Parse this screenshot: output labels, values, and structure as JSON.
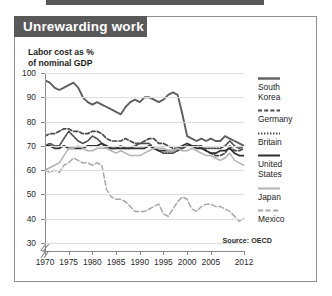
{
  "header": {
    "title": "Unrewarding work"
  },
  "axis_title": "Labor cost as %\nof nominal GDP",
  "source": "Source: OECD",
  "legend": [
    {
      "name": "South Korea",
      "label": "South\nKorea",
      "style": "solid-thick",
      "color": "#5e5e5e"
    },
    {
      "name": "Germany",
      "label": "Germany",
      "style": "dashed",
      "color": "#4a4a4a"
    },
    {
      "name": "Britain",
      "label": "Britain",
      "style": "dotted",
      "color": "#4a4a4a"
    },
    {
      "name": "United States",
      "label": "United\nStates",
      "style": "solid",
      "color": "#2f2f2f"
    },
    {
      "name": "Japan",
      "label": "Japan",
      "style": "solid-light",
      "color": "#b2b2b2"
    },
    {
      "name": "Mexico",
      "label": "Mexico",
      "style": "long-dash",
      "color": "#a8a8a8"
    }
  ],
  "chart_data": {
    "type": "line",
    "title": "Unrewarding work",
    "subtitle": "Labor cost as % of nominal GDP",
    "xlabel": "",
    "ylabel": "Labor cost as % of nominal GDP",
    "source": "Source: OECD",
    "xlim": [
      1970,
      2012
    ],
    "ylim": [
      30,
      100
    ],
    "yticks": [
      30,
      40,
      50,
      60,
      70,
      80,
      90,
      100
    ],
    "xticks": [
      1970,
      1975,
      1980,
      1985,
      1990,
      1995,
      2000,
      2005,
      2012
    ],
    "y_axis_break_below": 30,
    "grid": "horizontal",
    "legend_position": "right",
    "x": [
      1970,
      1971,
      1972,
      1973,
      1974,
      1975,
      1976,
      1977,
      1978,
      1979,
      1980,
      1981,
      1982,
      1983,
      1984,
      1985,
      1986,
      1987,
      1988,
      1989,
      1990,
      1991,
      1992,
      1993,
      1994,
      1995,
      1996,
      1997,
      1998,
      1999,
      2000,
      2001,
      2002,
      2003,
      2004,
      2005,
      2006,
      2007,
      2008,
      2009,
      2010,
      2011,
      2012
    ],
    "series": [
      {
        "name": "South Korea",
        "style": "solid-thick",
        "color": "#5e5e5e",
        "values": [
          97,
          96,
          94,
          93,
          94,
          95,
          96,
          94,
          90,
          88,
          87,
          88,
          87,
          86,
          85,
          84,
          83,
          86,
          88,
          89,
          88,
          90,
          90,
          89,
          88,
          89,
          91,
          92,
          91,
          83,
          74,
          73,
          72,
          73,
          72,
          73,
          72,
          72,
          74,
          73,
          72,
          71,
          70
        ]
      },
      {
        "name": "Germany",
        "style": "dashed",
        "color": "#4a4a4a",
        "values": [
          74,
          75,
          75,
          76,
          77,
          77,
          76,
          76,
          75,
          75,
          76,
          76,
          75,
          73,
          72,
          72,
          72,
          73,
          72,
          71,
          71,
          72,
          73,
          73,
          71,
          71,
          70,
          69,
          69,
          69,
          70,
          70,
          70,
          70,
          68,
          67,
          66,
          66,
          67,
          70,
          68,
          68,
          69
        ]
      },
      {
        "name": "Britain",
        "style": "dotted",
        "color": "#4a4a4a",
        "values": [
          70,
          71,
          70,
          70,
          73,
          76,
          74,
          72,
          71,
          72,
          74,
          73,
          71,
          69,
          69,
          69,
          70,
          69,
          69,
          70,
          71,
          71,
          71,
          69,
          68,
          67,
          67,
          67,
          68,
          69,
          70,
          70,
          70,
          69,
          69,
          69,
          69,
          69,
          70,
          72,
          70,
          69,
          70
        ]
      },
      {
        "name": "United States",
        "style": "solid",
        "color": "#2f2f2f",
        "values": [
          70,
          70,
          69,
          69,
          70,
          69,
          69,
          69,
          69,
          70,
          70,
          70,
          71,
          70,
          69,
          69,
          69,
          69,
          69,
          69,
          69,
          69,
          70,
          69,
          68,
          68,
          68,
          68,
          69,
          70,
          71,
          70,
          69,
          69,
          68,
          67,
          67,
          68,
          68,
          69,
          67,
          66,
          66
        ]
      },
      {
        "name": "Japan",
        "style": "solid-light",
        "color": "#b2b2b2",
        "values": [
          60,
          61,
          62,
          63,
          66,
          69,
          69,
          70,
          69,
          68,
          68,
          69,
          69,
          69,
          68,
          67,
          68,
          67,
          66,
          66,
          66,
          67,
          68,
          69,
          69,
          69,
          68,
          68,
          69,
          68,
          68,
          69,
          68,
          67,
          66,
          66,
          65,
          64,
          65,
          67,
          64,
          63,
          62
        ]
      },
      {
        "name": "Mexico",
        "style": "long-dash",
        "color": "#a8a8a8",
        "values": [
          60,
          59,
          60,
          59,
          62,
          63,
          65,
          64,
          63,
          63,
          62,
          63,
          62,
          52,
          49,
          48,
          48,
          47,
          45,
          43,
          43,
          43,
          44,
          45,
          46,
          42,
          41,
          44,
          47,
          49,
          48,
          44,
          43,
          45,
          46,
          46,
          45,
          45,
          44,
          43,
          41,
          39,
          40
        ]
      }
    ]
  }
}
